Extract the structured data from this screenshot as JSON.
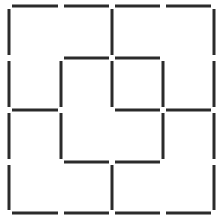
{
  "diagram": {
    "type": "matchstick-grid",
    "grid_size": 4,
    "stick_color": "#2b2b2b",
    "background": "#ffffff",
    "stick_width": 3,
    "gap": 3,
    "x_lines": [
      9,
      61,
      112,
      163,
      214
    ],
    "y_lines": [
      6,
      58,
      110,
      162,
      213
    ],
    "horizontal_sticks": [
      {
        "row": 0,
        "col": 0
      },
      {
        "row": 0,
        "col": 1
      },
      {
        "row": 0,
        "col": 2
      },
      {
        "row": 0,
        "col": 3
      },
      {
        "row": 1,
        "col": 1
      },
      {
        "row": 1,
        "col": 2
      },
      {
        "row": 2,
        "col": 0
      },
      {
        "row": 2,
        "col": 2
      },
      {
        "row": 2,
        "col": 3
      },
      {
        "row": 3,
        "col": 1
      },
      {
        "row": 3,
        "col": 2
      },
      {
        "row": 4,
        "col": 0
      },
      {
        "row": 4,
        "col": 1
      },
      {
        "row": 4,
        "col": 2
      },
      {
        "row": 4,
        "col": 3
      }
    ],
    "vertical_sticks": [
      {
        "col": 0,
        "row": 0
      },
      {
        "col": 0,
        "row": 1
      },
      {
        "col": 0,
        "row": 2
      },
      {
        "col": 0,
        "row": 3
      },
      {
        "col": 1,
        "row": 1
      },
      {
        "col": 1,
        "row": 2
      },
      {
        "col": 2,
        "row": 0
      },
      {
        "col": 2,
        "row": 1
      },
      {
        "col": 2,
        "row": 3
      },
      {
        "col": 3,
        "row": 1
      },
      {
        "col": 3,
        "row": 2
      },
      {
        "col": 4,
        "row": 0
      },
      {
        "col": 4,
        "row": 1
      },
      {
        "col": 4,
        "row": 2
      },
      {
        "col": 4,
        "row": 3
      }
    ],
    "stick_count": 30
  }
}
